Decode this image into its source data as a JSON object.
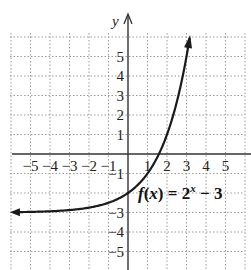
{
  "chart_data": {
    "type": "line",
    "title": "",
    "function_label": "f(x) = 2^x − 3",
    "function_parts": {
      "f": "f",
      "open": "(",
      "x": "x",
      "close": ")",
      "eq": " = 2",
      "exp": "x",
      "tail": " − 3"
    },
    "xlabel": "",
    "ylabel": "y",
    "xlim": [
      -6,
      6
    ],
    "ylim": [
      -6,
      6
    ],
    "grid": true,
    "grid_style": "dotted",
    "x_ticks": [
      -5,
      -4,
      -3,
      -2,
      -1,
      1,
      2,
      3,
      4,
      5
    ],
    "x_tick_labels": [
      "−5",
      "−4",
      "−3",
      "−2",
      "−1",
      "1",
      "2",
      "3",
      "4",
      "5"
    ],
    "y_ticks": [
      5,
      4,
      3,
      2,
      1,
      -1,
      -3,
      -4,
      -5
    ],
    "y_tick_labels": [
      "5",
      "4",
      "3",
      "2",
      "1",
      "−1",
      "−3",
      "−4",
      "−5"
    ],
    "series": [
      {
        "name": "f(x) = 2^x − 3",
        "x": [
          -6,
          -5,
          -4,
          -3,
          -2,
          -1,
          0,
          1,
          1.585,
          2,
          2.5,
          3
        ],
        "values": [
          -2.98,
          -2.97,
          -2.94,
          -2.88,
          -2.75,
          -2.5,
          -2,
          -1,
          0,
          1,
          2.66,
          5
        ],
        "asymptote_y": -3,
        "arrows": "both"
      }
    ],
    "legend": null,
    "annotations": [
      {
        "text": "f(x) = 2^x − 3",
        "x": 1.5,
        "y": -2.4
      }
    ],
    "colors": {
      "curve": "#1a1a1a",
      "axis": "#333333",
      "grid": "#9a9a9a",
      "text": "#222222"
    }
  }
}
